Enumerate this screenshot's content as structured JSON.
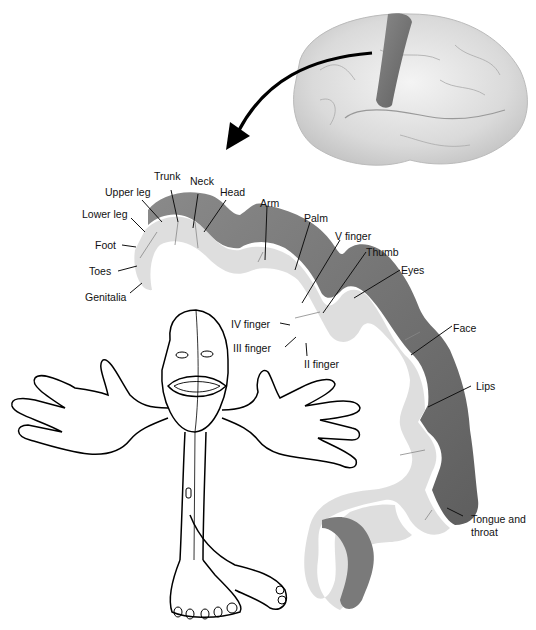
{
  "diagram": {
    "brain_inset": {
      "highlight_region": "postcentral gyrus",
      "highlight_color": "#7a7a7a"
    },
    "colors": {
      "cortex_dark": "#6e6e6e",
      "cortex_light": "#dcdcdc",
      "line": "#111111"
    },
    "labels": [
      {
        "id": "trunk",
        "text": "Trunk"
      },
      {
        "id": "neck",
        "text": "Neck"
      },
      {
        "id": "head",
        "text": "Head"
      },
      {
        "id": "upper-leg",
        "text": "Upper leg"
      },
      {
        "id": "lower-leg",
        "text": "Lower leg"
      },
      {
        "id": "foot",
        "text": "Foot"
      },
      {
        "id": "toes",
        "text": "Toes"
      },
      {
        "id": "genitalia",
        "text": "Genitalia"
      },
      {
        "id": "arm",
        "text": "Arm"
      },
      {
        "id": "palm",
        "text": "Palm"
      },
      {
        "id": "v-finger",
        "text": "V finger"
      },
      {
        "id": "thumb",
        "text": "Thumb"
      },
      {
        "id": "eyes",
        "text": "Eyes"
      },
      {
        "id": "iv-finger",
        "text": "IV finger"
      },
      {
        "id": "iii-finger",
        "text": "III finger"
      },
      {
        "id": "ii-finger",
        "text": "II finger"
      },
      {
        "id": "face",
        "text": "Face"
      },
      {
        "id": "lips",
        "text": "Lips"
      },
      {
        "id": "tongue-throat-1",
        "text": "Tongue and"
      },
      {
        "id": "tongue-throat-2",
        "text": "throat"
      }
    ]
  }
}
